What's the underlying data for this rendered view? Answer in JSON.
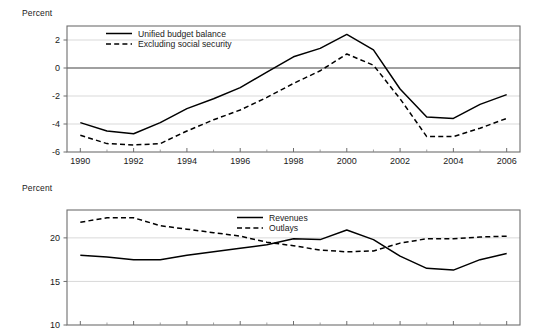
{
  "figure": {
    "background": "#ffffff",
    "line_color": "#000000"
  },
  "chart_data": [
    {
      "id": "budget-balance",
      "type": "line",
      "title": "",
      "xlabel": "",
      "ylabel": "Percent",
      "ylabel_text": "Percent",
      "xlim": [
        1989.5,
        2006.5
      ],
      "ylim": [
        -6,
        3
      ],
      "yticks": [
        2,
        0,
        -2,
        -4,
        -6
      ],
      "ytick_labels": [
        "2",
        "0",
        "-2",
        "-4",
        "-6"
      ],
      "xticks": [
        1990,
        1992,
        1994,
        1996,
        1998,
        2000,
        2002,
        2004,
        2006
      ],
      "xtick_labels": [
        "1990",
        "1992",
        "1994",
        "1996",
        "1998",
        "2000",
        "2002",
        "2004",
        "2006"
      ],
      "minor_xticks": [
        1991,
        1993,
        1995,
        1997,
        1999,
        2001,
        2003,
        2005
      ],
      "grid": "horizontal",
      "zero_line": 0,
      "legend_position": "top-center-left",
      "x": [
        1990,
        1991,
        1992,
        1993,
        1994,
        1995,
        1996,
        1997,
        1998,
        1999,
        2000,
        2001,
        2002,
        2003,
        2004,
        2005,
        2006
      ],
      "series": [
        {
          "name": "Unified budget balance",
          "style": "solid",
          "values": [
            -3.9,
            -4.5,
            -4.7,
            -3.9,
            -2.9,
            -2.2,
            -1.4,
            -0.3,
            0.8,
            1.4,
            2.4,
            1.3,
            -1.5,
            -3.5,
            -3.6,
            -2.6,
            -1.9
          ]
        },
        {
          "name": "Excluding social security",
          "style": "dashed",
          "values": [
            -4.8,
            -5.4,
            -5.5,
            -5.4,
            -4.5,
            -3.7,
            -3.0,
            -2.1,
            -1.1,
            -0.2,
            1.0,
            0.2,
            -2.2,
            -4.9,
            -4.9,
            -4.3,
            -3.6
          ]
        }
      ]
    },
    {
      "id": "revenues-outlays",
      "type": "line",
      "title": "",
      "xlabel": "",
      "ylabel": "Percent",
      "ylabel_text": "Percent",
      "xlim": [
        1989.5,
        2006.5
      ],
      "ylim": [
        10,
        23.2
      ],
      "yticks": [
        20,
        15,
        10
      ],
      "ytick_labels": [
        "20",
        "15",
        "10"
      ],
      "xticks": [
        1990,
        1992,
        1994,
        1996,
        1998,
        2000,
        2002,
        2004,
        2006
      ],
      "xtick_labels": [
        "",
        "",
        "",
        "",
        "",
        "",
        "",
        "",
        ""
      ],
      "minor_xticks": [
        1991,
        1993,
        1995,
        1997,
        1999,
        2001,
        2003,
        2005
      ],
      "grid": "horizontal",
      "legend_position": "top-center",
      "x": [
        1990,
        1991,
        1992,
        1993,
        1994,
        1995,
        1996,
        1997,
        1998,
        1999,
        2000,
        2001,
        2002,
        2003,
        2004,
        2005,
        2006
      ],
      "series": [
        {
          "name": "Revenues",
          "style": "solid",
          "values": [
            18.0,
            17.8,
            17.5,
            17.5,
            18.0,
            18.4,
            18.8,
            19.2,
            19.9,
            19.8,
            20.9,
            19.8,
            17.9,
            16.5,
            16.3,
            17.5,
            18.2
          ]
        },
        {
          "name": "Outlays",
          "style": "dashed",
          "values": [
            21.8,
            22.3,
            22.3,
            21.4,
            21.0,
            20.6,
            20.2,
            19.5,
            19.1,
            18.6,
            18.4,
            18.5,
            19.4,
            19.9,
            19.9,
            20.1,
            20.2
          ]
        }
      ]
    }
  ]
}
